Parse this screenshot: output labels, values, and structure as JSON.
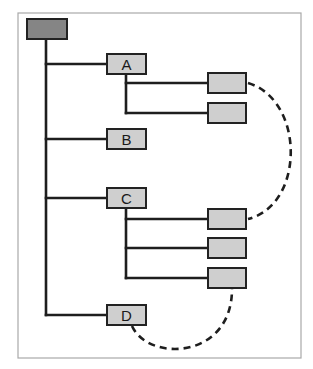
{
  "diagram": {
    "type": "tree-hierarchy",
    "frame": {
      "x": 18,
      "y": 13,
      "w": 283,
      "h": 345
    },
    "colors": {
      "root_fill": "#858585",
      "node_fill": "#cfcfcf",
      "line": "#1e1e1e",
      "frame": "#a9a9a9"
    },
    "root": {
      "id": "root",
      "label": "",
      "x": 27,
      "y": 19,
      "w": 40,
      "h": 20
    },
    "nodes": [
      {
        "id": "A",
        "label": "A",
        "x": 107,
        "y": 54,
        "w": 39,
        "h": 20
      },
      {
        "id": "B",
        "label": "B",
        "x": 107,
        "y": 129,
        "w": 39,
        "h": 20
      },
      {
        "id": "C",
        "label": "C",
        "x": 107,
        "y": 188,
        "w": 39,
        "h": 20
      },
      {
        "id": "D",
        "label": "D",
        "x": 107,
        "y": 305,
        "w": 39,
        "h": 20
      }
    ],
    "leaves": [
      {
        "id": "A1",
        "parent": "A",
        "label": "",
        "x": 208,
        "y": 73,
        "w": 38,
        "h": 20
      },
      {
        "id": "A2",
        "parent": "A",
        "label": "",
        "x": 208,
        "y": 103,
        "w": 38,
        "h": 20
      },
      {
        "id": "C1",
        "parent": "C",
        "label": "",
        "x": 208,
        "y": 209,
        "w": 38,
        "h": 20
      },
      {
        "id": "C2",
        "parent": "C",
        "label": "",
        "x": 208,
        "y": 238,
        "w": 38,
        "h": 20
      },
      {
        "id": "C3",
        "parent": "C",
        "label": "",
        "x": 208,
        "y": 268,
        "w": 38,
        "h": 20
      }
    ],
    "dashed_links": [
      {
        "from": "A1",
        "to": "C1"
      },
      {
        "from": "D",
        "to": "C3"
      }
    ]
  }
}
